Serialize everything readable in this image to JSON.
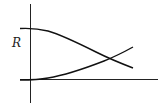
{
  "diagram": {
    "type": "two-curve crossing plot",
    "y_axis_label": "R",
    "curves": [
      {
        "name": "decreasing-curve",
        "description": "starts high and flat near the y-axis, decreases, crosses the other curve"
      },
      {
        "name": "increasing-curve",
        "description": "starts at the x-axis baseline, increases, crosses the other curve"
      }
    ],
    "colors": {
      "line": "#111111",
      "axis": "#222222",
      "background": "#ffffff"
    }
  }
}
